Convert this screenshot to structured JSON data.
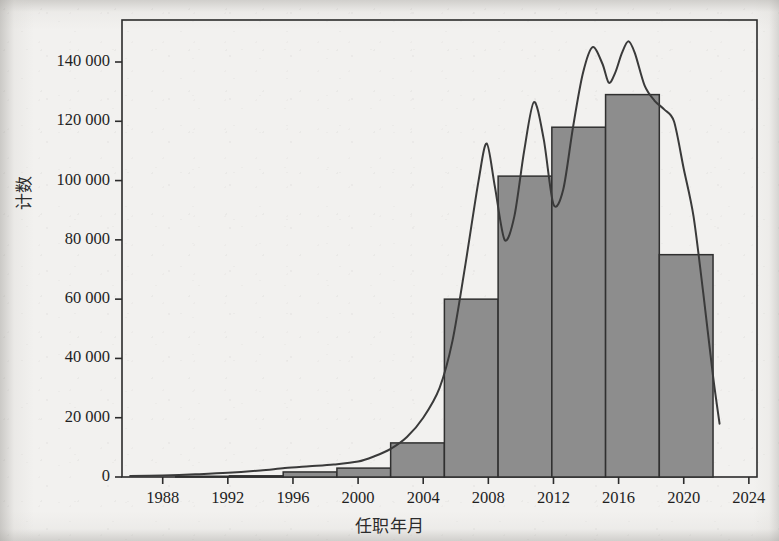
{
  "figure": {
    "ylabel": "计数",
    "xlabel": "任职年月",
    "bar_fill_color": "#8d8d8d",
    "bar_edge_color": "#303030",
    "curve_color": "#3a3a3a",
    "axis_color": "#2b2b2b",
    "background_color": "#f2f1ef"
  },
  "axes": {
    "y_tick_labels": [
      "140 000",
      "120 000",
      "100 000",
      "80 000",
      "60 000",
      "40 000",
      "20 000",
      "0"
    ],
    "y_tick_values": [
      140000,
      120000,
      100000,
      80000,
      60000,
      40000,
      20000,
      0
    ],
    "x_tick_labels": [
      "1988",
      "1992",
      "1996",
      "2000",
      "2004",
      "2008",
      "2012",
      "2016",
      "2020",
      "2024"
    ],
    "x_tick_values": [
      1988,
      1992,
      1996,
      2000,
      2004,
      2008,
      2012,
      2016,
      2020,
      2024
    ]
  },
  "chart_data": {
    "type": "bar",
    "title": "",
    "subtitle": "",
    "xlabel": "任职年月",
    "ylabel": "计数",
    "xlim": [
      1985.5,
      2024.5
    ],
    "ylim": [
      0,
      152000
    ],
    "grid": false,
    "legend": null,
    "histogram": {
      "bin_edges": [
        1985.5,
        1988.8,
        1992.1,
        1995.4,
        1998.7,
        2002.0,
        2005.3,
        2008.6,
        2011.9,
        2015.2,
        2018.5,
        2021.8
      ],
      "bin_centers": [
        1987.1,
        1990.4,
        1993.7,
        1997.0,
        2000.3,
        2003.6,
        2006.9,
        2010.2,
        2013.5,
        2016.8,
        2020.1
      ],
      "values": [
        200,
        250,
        400,
        1700,
        3000,
        11500,
        60000,
        101500,
        118000,
        129000,
        75000
      ]
    },
    "density_curve": {
      "name": "核密度曲线",
      "x": [
        1986.0,
        1988.0,
        1990.0,
        1992.0,
        1994.0,
        1995.5,
        1997.0,
        1998.5,
        2000.0,
        2001.0,
        2002.0,
        2003.0,
        2004.0,
        2005.0,
        2005.8,
        2006.6,
        2007.4,
        2007.9,
        2008.4,
        2009.0,
        2009.6,
        2010.2,
        2010.8,
        2011.4,
        2012.0,
        2012.6,
        2013.2,
        2013.8,
        2014.4,
        2015.0,
        2015.4,
        2015.8,
        2016.2,
        2016.6,
        2017.0,
        2017.6,
        2018.2,
        2018.8,
        2019.4,
        2020.0,
        2020.6,
        2021.2,
        2021.8,
        2022.2
      ],
      "y": [
        300,
        500,
        900,
        1400,
        2200,
        3000,
        3600,
        4200,
        5200,
        7000,
        9500,
        13500,
        20000,
        30000,
        46000,
        72000,
        100000,
        112500,
        98000,
        80000,
        88000,
        110000,
        126500,
        114000,
        92000,
        97000,
        118000,
        136000,
        145000,
        139500,
        133000,
        136500,
        143000,
        147000,
        143000,
        132000,
        127000,
        124000,
        120000,
        104000,
        88000,
        62000,
        34000,
        18000
      ]
    }
  }
}
